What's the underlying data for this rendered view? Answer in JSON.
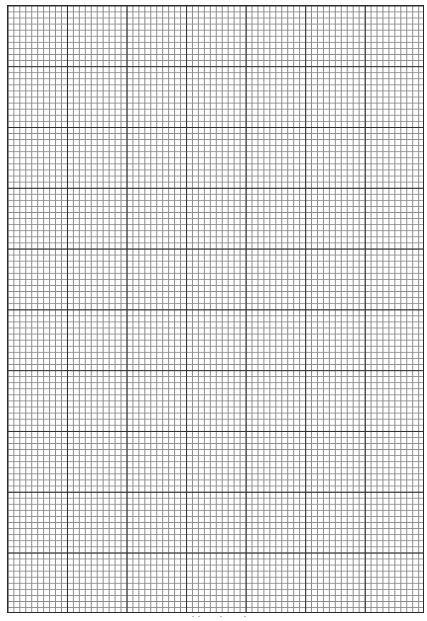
{
  "sheet": {
    "type": "graph-paper",
    "major_columns": 7,
    "major_rows": 10,
    "minor_per_major": 10,
    "colors": {
      "background": "#ffffff",
      "major_line": "#2e2e2e",
      "minor_line": "#8c8c8c"
    }
  }
}
